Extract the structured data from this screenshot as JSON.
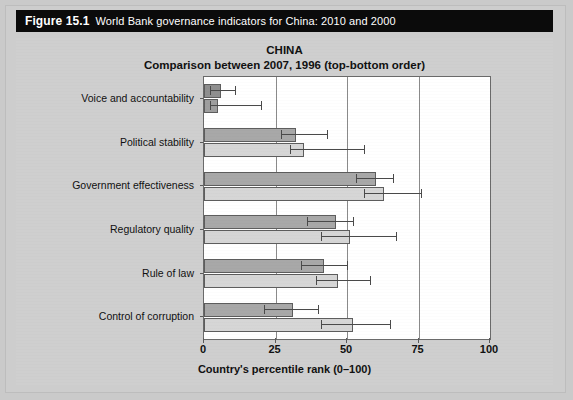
{
  "caption": {
    "figure_number": "Figure 15.1",
    "text": "World Bank governance indicators for China: 2010 and 2000"
  },
  "chart_data": {
    "type": "bar",
    "orientation": "horizontal",
    "title": "CHINA",
    "subtitle": "Comparison between 2007, 1996 (top-bottom order)",
    "xlabel": "Country's percentile rank (0–100)",
    "ylabel": "",
    "xlim": [
      0,
      100
    ],
    "xticks": [
      0,
      25,
      50,
      75,
      100
    ],
    "xticklabels": [
      "0",
      "25",
      "50",
      "75",
      "100"
    ],
    "grid": true,
    "legend_position": "none",
    "categories": [
      "Voice and accountability",
      "Political stability",
      "Government effectiveness",
      "Regulatory quality",
      "Rule of law",
      "Control of corruption"
    ],
    "series": [
      {
        "name": "2007",
        "color": "#a8a8a8",
        "values": [
          6,
          32,
          60,
          46,
          42,
          31
        ],
        "error_low": [
          2,
          27,
          53,
          36,
          34,
          21
        ],
        "error_high": [
          11,
          43,
          66,
          52,
          50,
          40
        ]
      },
      {
        "name": "1996",
        "color": "#d6d6d6",
        "values": [
          5,
          35,
          63,
          51,
          47,
          52
        ],
        "error_low": [
          2,
          30,
          56,
          41,
          39,
          41
        ],
        "error_high": [
          20,
          56,
          76,
          67,
          58,
          65
        ]
      }
    ]
  }
}
